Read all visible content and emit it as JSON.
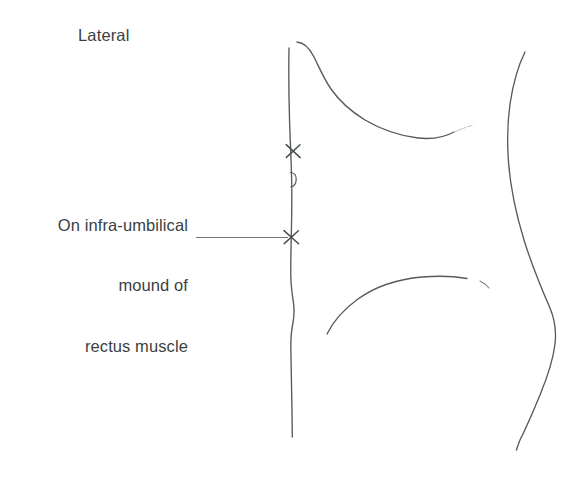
{
  "figure": {
    "view_label": "Lateral",
    "background_color": "#ffffff",
    "line_color": "#555a5e",
    "text_color": "#3b3f42",
    "annotation": {
      "name": "injection-site-callout",
      "lines": [
        "On infra-umbilical",
        "mound of",
        "rectus muscle"
      ],
      "full_text": "On infra-umbilical mound of rectus muscle"
    },
    "markers": [
      {
        "name": "upper-injection-site-marker",
        "glyph": "x-mark",
        "x": 293,
        "y": 151
      },
      {
        "name": "lower-injection-site-marker",
        "glyph": "x-mark",
        "x": 291,
        "y": 237
      }
    ],
    "landmarks": [
      {
        "name": "umbilicus",
        "x": 288,
        "y": 180
      },
      {
        "name": "anterior-torso-contour"
      },
      {
        "name": "breast-inframammary-contour"
      },
      {
        "name": "posterior-back-contour"
      },
      {
        "name": "inguinal-fold-contour"
      }
    ]
  }
}
